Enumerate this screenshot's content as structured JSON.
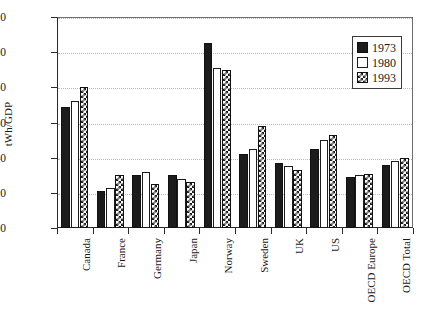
{
  "chart_data": {
    "type": "bar",
    "title": "",
    "xlabel": "",
    "ylabel": "tWh/GDP",
    "ylim": [
      0.0,
      1.2
    ],
    "ytick_labels": [
      "0.00",
      "0.20",
      "0.40",
      "0.60",
      "0.80",
      "1.00",
      "1.20"
    ],
    "ytick_values": [
      0.0,
      0.2,
      0.4,
      0.6,
      0.8,
      1.0,
      1.2
    ],
    "grid": "horizontal-dotted",
    "legend_position": "top-right",
    "categories": [
      "Canada",
      "France",
      "Germany",
      "Japan",
      "Norway",
      "Sweden",
      "UK",
      "US",
      "OECD Europe",
      "OECD Total"
    ],
    "series": [
      {
        "name": "1973",
        "fill": "solid-black",
        "values": [
          0.69,
          0.21,
          0.3,
          0.3,
          1.05,
          0.42,
          0.37,
          0.45,
          0.29,
          0.36
        ]
      },
      {
        "name": "1980",
        "fill": "open-white",
        "values": [
          0.72,
          0.23,
          0.32,
          0.28,
          0.91,
          0.45,
          0.35,
          0.5,
          0.3,
          0.38
        ]
      },
      {
        "name": "1993",
        "fill": "checkerboard",
        "values": [
          0.8,
          0.3,
          0.25,
          0.26,
          0.9,
          0.58,
          0.33,
          0.53,
          0.31,
          0.4
        ]
      }
    ]
  },
  "colors": {
    "series_1973": "#1c1c1c",
    "series_1980": "#ffffff",
    "series_1993_pattern": "#1c1c1c",
    "axis": "#2a2a2a",
    "gridline": "#b9b9b9",
    "background": "#ffffff"
  }
}
